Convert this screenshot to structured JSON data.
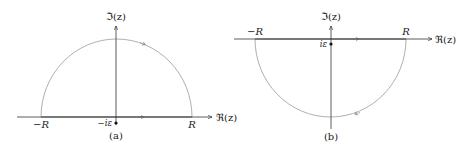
{
  "figures": [
    {
      "id": "a",
      "caption": "(a)",
      "imag_axis_label": "ℑ(z)",
      "real_axis_label": "ℜ(z)",
      "left_endpoint_label": "−R",
      "right_endpoint_label": "R",
      "pole_label": "−iε",
      "contour": "upper semicircle closed along real axis from −R to R"
    },
    {
      "id": "b",
      "caption": "(b)",
      "imag_axis_label": "ℑ(z)",
      "real_axis_label": "ℜ(z)",
      "left_endpoint_label": "−R",
      "right_endpoint_label": "R",
      "pole_label": "iε",
      "contour": "lower semicircle closed along real axis from −R to R"
    }
  ],
  "colors": {
    "axis": "#333333",
    "contour": "#9a9a9a",
    "pole": "#111111"
  }
}
